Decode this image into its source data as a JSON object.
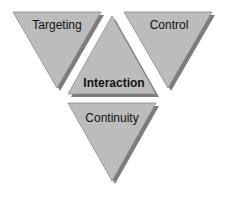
{
  "diagram": {
    "colors": {
      "fill": "#bcbcbc",
      "shadow": "#7c7c7c",
      "edge": "#8a8a8a",
      "text": "#111111",
      "background": "#ffffff"
    },
    "triangles": [
      {
        "id": "targeting",
        "label": "Targeting",
        "orientation": "down",
        "emphasis": false
      },
      {
        "id": "control",
        "label": "Control",
        "orientation": "down",
        "emphasis": false
      },
      {
        "id": "interaction",
        "label": "Interaction",
        "orientation": "up",
        "emphasis": true
      },
      {
        "id": "continuity",
        "label": "Continuity",
        "orientation": "down",
        "emphasis": false
      }
    ]
  }
}
